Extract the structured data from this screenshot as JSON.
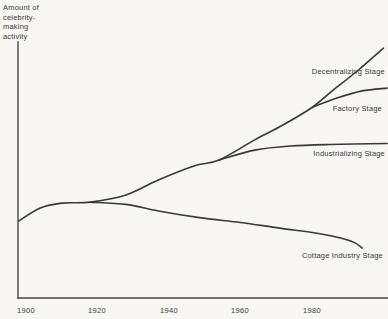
{
  "chart_data": {
    "type": "line",
    "title": "",
    "xlabel": "",
    "ylabel": "Amount of celebrity-making activity",
    "ylabel_display": "Amount of\ncelebrity-\nmaking\nactivity",
    "x_ticks": [
      "1900",
      "1920",
      "1940",
      "1960",
      "1980"
    ],
    "x_range_years": [
      1898,
      2001
    ],
    "y_axis_scale": "relative amount (no numeric scale shown)",
    "ylim": [
      0,
      110
    ],
    "grid": false,
    "legend_position": "inline labels at right end of each curve",
    "series": [
      {
        "name": "decentralizing-stage",
        "label": "Decentralizing Stage",
        "branch_point_year": null,
        "points": [
          [
            1898,
            30.6
          ],
          [
            1904,
            35.7
          ],
          [
            1910,
            37.6
          ],
          [
            1918,
            38.0
          ],
          [
            1928,
            40.8
          ],
          [
            1937,
            46.7
          ],
          [
            1947,
            52.2
          ],
          [
            1954,
            54.5
          ],
          [
            1964,
            62.4
          ],
          [
            1972,
            68.3
          ],
          [
            1980,
            75.1
          ],
          [
            1986,
            82.0
          ],
          [
            1993,
            89.8
          ],
          [
            2000,
            98.4
          ]
        ]
      },
      {
        "name": "factory-stage",
        "label": "Factory Stage",
        "branch_point_year": 1980,
        "points": [
          [
            1980,
            75.1
          ],
          [
            1987,
            78.8
          ],
          [
            1994,
            81.6
          ],
          [
            2001,
            82.7
          ]
        ]
      },
      {
        "name": "industrializing-stage",
        "label": "Industrializing Stage",
        "branch_point_year": 1954,
        "points": [
          [
            1954,
            54.5
          ],
          [
            1964,
            58.4
          ],
          [
            1974,
            60.0
          ],
          [
            1985,
            60.6
          ],
          [
            2001,
            61.0
          ]
        ]
      },
      {
        "name": "cottage-industry-stage",
        "label": "Cottage Industry Stage",
        "branch_point_year": 1918,
        "points": [
          [
            1918,
            38.0
          ],
          [
            1928,
            37.1
          ],
          [
            1937,
            34.5
          ],
          [
            1949,
            31.8
          ],
          [
            1960,
            30.0
          ],
          [
            1971,
            27.8
          ],
          [
            1981,
            25.9
          ],
          [
            1988,
            23.9
          ],
          [
            1992,
            22.0
          ],
          [
            1994,
            20.0
          ]
        ]
      }
    ]
  }
}
